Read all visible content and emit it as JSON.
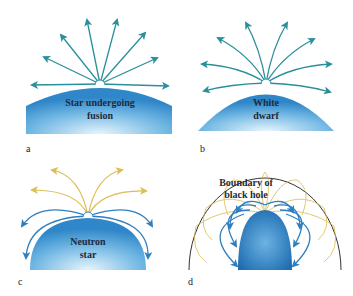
{
  "panels": {
    "a": {
      "letter": "a",
      "label_line1": "Star undergoing",
      "label_line2": "fusion"
    },
    "b": {
      "letter": "b",
      "label_line1": "White",
      "label_line2": "dwarf"
    },
    "c": {
      "letter": "c",
      "label_line1": "Neutron",
      "label_line2": "star"
    },
    "d": {
      "letter": "d",
      "label_line1": "Boundary of",
      "label_line2": "black hole"
    }
  },
  "colors": {
    "teal_arrow": "#2a8f9a",
    "blue_arrow": "#2f7fc0",
    "yellow_arrow": "#d9b740",
    "star_fill_dark": "#2f86c8",
    "star_fill_light": "#dff0fb",
    "boundary_line": "#333333"
  }
}
